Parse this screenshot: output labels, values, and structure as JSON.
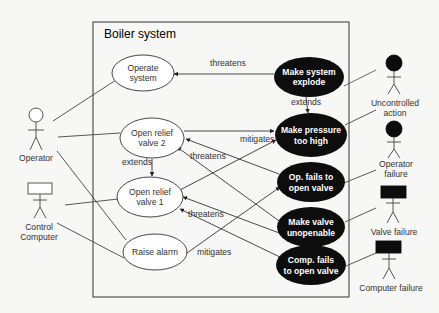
{
  "diagram": {
    "title": "Boiler system",
    "actors": [
      {
        "id": "operator",
        "label": "Operator",
        "type": "normal"
      },
      {
        "id": "control_computer",
        "label_lines": [
          "Control",
          "Computer"
        ],
        "type": "normal-boxhead"
      },
      {
        "id": "uncontrolled_action",
        "label_lines": [
          "Uncontrolled",
          "action"
        ],
        "type": "misuser"
      },
      {
        "id": "operator_failure",
        "label_lines": [
          "Operator",
          "failure"
        ],
        "type": "misuser"
      },
      {
        "id": "valve_failure",
        "label": "Valve failure",
        "type": "misuser-boxhead"
      },
      {
        "id": "computer_failure",
        "label": "Computer failure",
        "type": "misuser-boxhead"
      }
    ],
    "use_cases": [
      {
        "id": "operate_system",
        "lines": [
          "Operate",
          "system"
        ]
      },
      {
        "id": "open_relief_valve_2",
        "lines": [
          "Open relief",
          "valve 2"
        ]
      },
      {
        "id": "open_relief_valve_1",
        "lines": [
          "Open relief",
          "valve 1"
        ]
      },
      {
        "id": "raise_alarm",
        "lines": [
          "Raise alarm"
        ]
      }
    ],
    "misuse_cases": [
      {
        "id": "make_system_explode",
        "lines": [
          "Make system",
          "explode"
        ]
      },
      {
        "id": "make_pressure_too_high",
        "lines": [
          "Make pressure",
          "too high"
        ]
      },
      {
        "id": "op_fails_to_open_valve",
        "lines": [
          "Op. fails to",
          "open valve"
        ]
      },
      {
        "id": "make_valve_unopenable",
        "lines": [
          "Make valve",
          "unopenable"
        ]
      },
      {
        "id": "comp_fails_to_open_valve",
        "lines": [
          "Comp. fails",
          "to open valve"
        ]
      }
    ],
    "relation_labels": {
      "threatens_1": "threatens",
      "extends_1": "extends",
      "mitigates_1": "mitigates",
      "extends_2": "extends",
      "threatens_2": "threatens",
      "threatens_3": "threatens",
      "mitigates_2": "mitigates"
    },
    "colors": {
      "line": "#333333",
      "misuse_fill": "#0d0d0d",
      "misuse_text": "#ffffff",
      "usecase_fill": "#ffffff"
    }
  }
}
